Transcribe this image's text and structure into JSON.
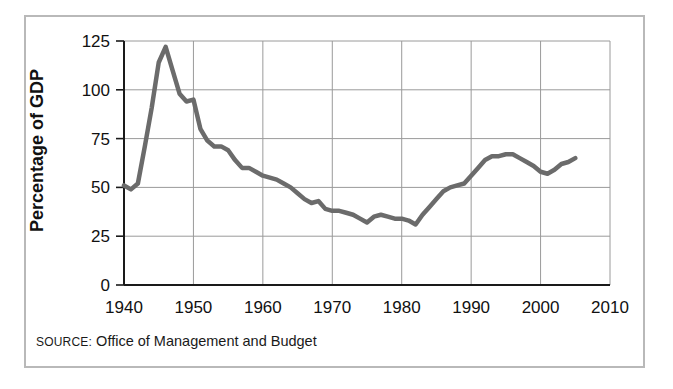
{
  "figure": {
    "source_prefix": "SOURCE:",
    "source_text": " Office of Management and Budget",
    "frame_color": "#b9b9b9",
    "background_color": "#ffffff"
  },
  "chart_data": {
    "type": "line",
    "title": "",
    "subtitle": "",
    "xlabel": "",
    "ylabel": "Percentage of GDP",
    "xlim": [
      1940,
      2010
    ],
    "ylim": [
      0,
      125
    ],
    "grid": true,
    "legend": "none",
    "line_color": "#6b6b6b",
    "line_width": 4.5,
    "gridline_color": "#9a9a9a",
    "axis_color": "#1a1a1a",
    "xticks": [
      1940,
      1950,
      1960,
      1970,
      1980,
      1990,
      2000,
      2010
    ],
    "xtick_labels": [
      "1940",
      "1950",
      "1960",
      "1970",
      "1980",
      "1990",
      "2000",
      "2010"
    ],
    "yticks": [
      0,
      25,
      50,
      75,
      100,
      125
    ],
    "ytick_labels": [
      "0",
      "25",
      "50",
      "75",
      "100",
      "125"
    ],
    "series": [
      {
        "name": "Federal debt as percentage of GDP",
        "x": [
          1940,
          1941,
          1942,
          1943,
          1944,
          1945,
          1946,
          1947,
          1948,
          1949,
          1950,
          1951,
          1952,
          1953,
          1954,
          1955,
          1956,
          1957,
          1958,
          1959,
          1960,
          1961,
          1962,
          1963,
          1964,
          1965,
          1966,
          1967,
          1968,
          1969,
          1970,
          1971,
          1972,
          1973,
          1974,
          1975,
          1976,
          1977,
          1978,
          1979,
          1980,
          1981,
          1982,
          1983,
          1984,
          1985,
          1986,
          1987,
          1988,
          1989,
          1990,
          1991,
          1992,
          1993,
          1994,
          1995,
          1996,
          1997,
          1998,
          1999,
          2000,
          2001,
          2002,
          2003,
          2004,
          2005
        ],
        "values": [
          51,
          49,
          52,
          71,
          91,
          114,
          122,
          110,
          98,
          94,
          95,
          80,
          74,
          71,
          71,
          69,
          64,
          60,
          60,
          58,
          56,
          55,
          54,
          52,
          50,
          47,
          44,
          42,
          43,
          39,
          38,
          38,
          37,
          36,
          34,
          32,
          35,
          36,
          35,
          34,
          34,
          33,
          31,
          36,
          40,
          44,
          48,
          50,
          51,
          52,
          56,
          60,
          64,
          66,
          66,
          67,
          67,
          65,
          63,
          61,
          58,
          57,
          59,
          62,
          63,
          65
        ]
      }
    ]
  }
}
